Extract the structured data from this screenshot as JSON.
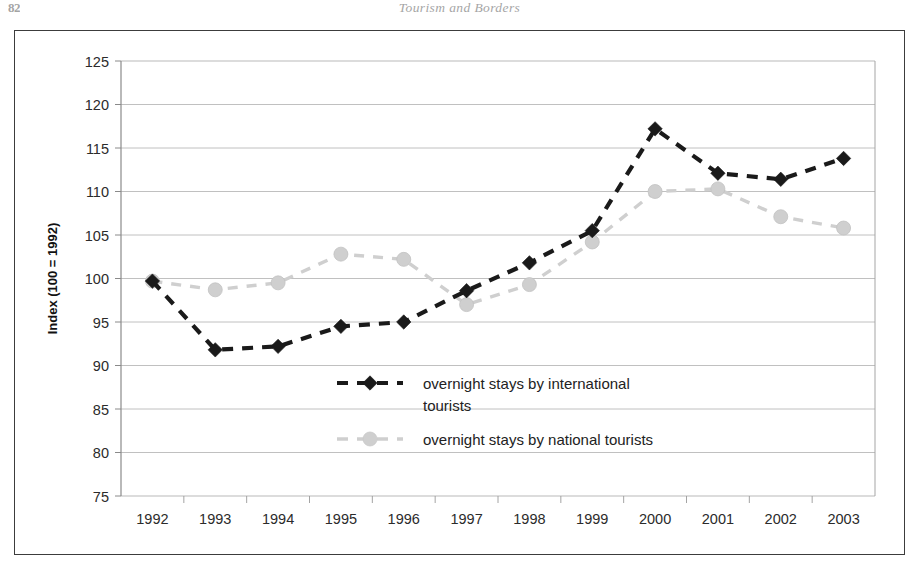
{
  "page": {
    "number": "82",
    "running_head": "Tourism and Borders"
  },
  "chart_data": {
    "type": "line",
    "title": "",
    "subtitle": "",
    "xlabel": "",
    "ylabel": "Index (100 = 1992)",
    "categories": [
      "1992",
      "1993",
      "1994",
      "1995",
      "1996",
      "1997",
      "1998",
      "1999",
      "2000",
      "2001",
      "2002",
      "2003"
    ],
    "ylim": [
      75,
      125
    ],
    "ytick_step": 5,
    "yticks": [
      "125",
      "120",
      "115",
      "110",
      "105",
      "100",
      "95",
      "90",
      "85",
      "80",
      "75"
    ],
    "grid": "horizontal",
    "legend_position": "inside-center-bottom",
    "series": [
      {
        "name": "overnight stays by international tourists",
        "marker": "diamond",
        "line_style": "dashed",
        "color": "#1a1a1a",
        "values": [
          99.7,
          91.8,
          92.2,
          94.5,
          95.0,
          98.6,
          101.8,
          105.5,
          117.2,
          112.1,
          111.4,
          113.8
        ]
      },
      {
        "name": "overnight stays by national tourists",
        "marker": "circle",
        "line_style": "dashed",
        "color": "#cfcfcf",
        "values": [
          99.7,
          98.7,
          99.5,
          102.8,
          102.2,
          97.0,
          99.3,
          104.2,
          110.0,
          110.3,
          107.1,
          105.8
        ]
      }
    ]
  }
}
